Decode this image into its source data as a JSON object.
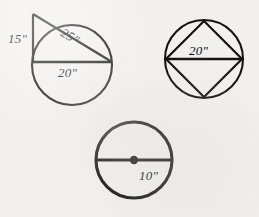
{
  "sheet": {
    "background_color": "#f1f0ee",
    "ink_color": "#141414",
    "title": "Circle geometry figures worksheet"
  },
  "figures": [
    {
      "id": "figure-1",
      "name": "circle-with-right-triangle",
      "description": "Circle with a right triangle whose vertical leg rises from the left end of a horizontal chord and whose hypotenuse crosses the circle",
      "circle": {
        "cx": 72,
        "cy": 65,
        "r": 40
      },
      "apex": {
        "x": 33,
        "y": 14
      },
      "chord_left": {
        "x": 33,
        "y": 62
      },
      "chord_right": {
        "x": 112,
        "y": 62
      },
      "labels": {
        "vertical_leg": "15\"",
        "hypotenuse": "25\"",
        "horizontal_leg": "20\""
      }
    },
    {
      "id": "figure-2",
      "name": "circle-with-inscribed-square",
      "description": "Circle with an inscribed square rotated 45 degrees, horizontal diagonal drawn",
      "circle": {
        "cx": 204,
        "cy": 59,
        "r": 39
      },
      "vertices": {
        "top": {
          "x": 204,
          "y": 21
        },
        "right": {
          "x": 242,
          "y": 59
        },
        "bottom": {
          "x": 204,
          "y": 97
        },
        "left": {
          "x": 166,
          "y": 59
        }
      },
      "labels": {
        "diagonal": "20\""
      }
    },
    {
      "id": "figure-3",
      "name": "circle-with-diameter-and-center",
      "description": "Circle with a bold outline, a horizontal diameter and a filled center point",
      "circle": {
        "cx": 134,
        "cy": 160,
        "r": 38
      },
      "diameter_left": {
        "x": 96,
        "y": 160
      },
      "diameter_right": {
        "x": 172,
        "y": 160
      },
      "center_dot": {
        "x": 134,
        "y": 160,
        "r": 4
      },
      "labels": {
        "radius_or_diameter": "10\""
      }
    }
  ]
}
